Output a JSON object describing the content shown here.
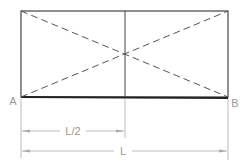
{
  "diagram": {
    "points": {
      "a": "A",
      "b": "B"
    },
    "dimensions": {
      "half": "L/2",
      "full": "L"
    },
    "colors": {
      "outline": "#333333",
      "dimension": "#aaaaaa",
      "label": "#999999"
    }
  }
}
